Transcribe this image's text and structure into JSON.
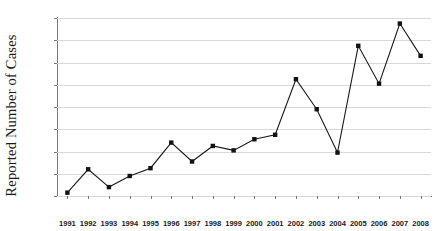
{
  "chart_data": {
    "type": "line",
    "title": "",
    "subtitle": "",
    "xlabel": "",
    "ylabel": "Reported Number of Cases",
    "categories": [
      "1991",
      "1992",
      "1993",
      "1994",
      "1995",
      "1996",
      "1997",
      "1998",
      "1999",
      "2000",
      "2001",
      "2002",
      "2003",
      "2004",
      "2005",
      "2006",
      "2007",
      "2008"
    ],
    "values": [
      3,
      24,
      8,
      18,
      25,
      48,
      31,
      45,
      41,
      51,
      55,
      105,
      78,
      39,
      135,
      101,
      155,
      126
    ],
    "series": [
      {
        "name": "Reported Number of Cases",
        "values": [
          3,
          24,
          8,
          18,
          25,
          48,
          31,
          45,
          41,
          51,
          55,
          105,
          78,
          39,
          135,
          101,
          155,
          126
        ]
      }
    ],
    "ylim": [
      0,
      160
    ],
    "yticks": [
      0,
      20,
      40,
      60,
      80,
      100,
      120,
      140,
      160
    ],
    "ytick_labels": [
      "0",
      "20",
      "40",
      "60",
      "80",
      "100",
      "120",
      "140",
      "160"
    ],
    "xtick_labels": [
      "1991",
      "1992",
      "1993",
      "1994",
      "1995",
      "1996",
      "1997",
      "1998",
      "1999",
      "2000",
      "2001",
      "2002",
      "2003",
      "2004",
      "2005",
      "2006",
      "2007",
      "2008"
    ],
    "grid": "horizontal",
    "legend": "none",
    "marker": "filled-square",
    "line_color": "#1a1a1a",
    "marker_color": "#111111",
    "grid_color": "#d8d8d8",
    "axis_color": "#7a7a7a",
    "background_color": "#ffffff"
  },
  "axes": {
    "y_title": "Reported Number of Cases"
  }
}
